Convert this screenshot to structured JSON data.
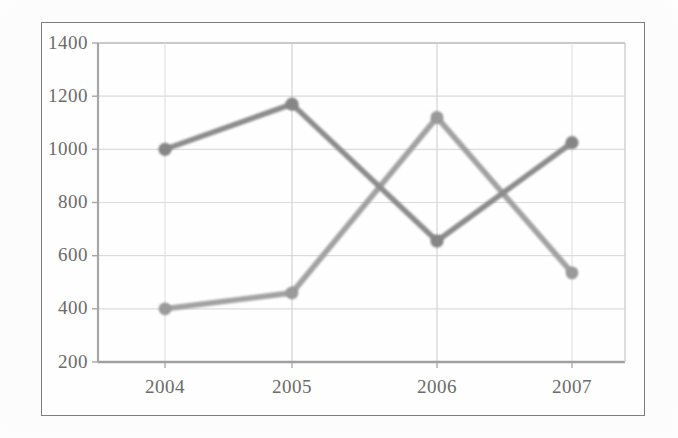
{
  "chart_data": {
    "type": "line",
    "title": "",
    "subtitle": "",
    "xlabel": "",
    "ylabel": "",
    "categories": [
      "2004",
      "2005",
      "2006",
      "2007"
    ],
    "ylim": [
      200,
      1400
    ],
    "yticks": [
      200,
      400,
      600,
      800,
      1000,
      1200,
      1400
    ],
    "ytick_labels": [
      "200",
      "400",
      "600",
      "800",
      "1000",
      "1200",
      "1400"
    ],
    "grid": true,
    "grid_axis": "both",
    "legend": "none",
    "series": [
      {
        "name": "series-1",
        "color": "#8c8c8c",
        "marker": "circle",
        "values": [
          1000,
          1170,
          655,
          1025
        ]
      },
      {
        "name": "series-2",
        "color": "#9a9a9a",
        "marker": "circle",
        "values": [
          400,
          460,
          1120,
          535
        ]
      }
    ],
    "annotations": []
  },
  "axes": {
    "y_tick_labels": [
      "1400",
      "1200",
      "1000",
      "800",
      "600",
      "400",
      "200"
    ],
    "x_tick_labels": [
      "2004",
      "2005",
      "2006",
      "2007"
    ]
  },
  "colors": {
    "frame_border": "#7c7c7c",
    "plot_background": "#ffffff",
    "gridline": "#d9d9d9",
    "axis_line": "#9e9e9e",
    "tick_text": "#6b6b6b",
    "series_1": "#8c8c8c",
    "series_2": "#9a9a9a",
    "page_background": "#fdfdfd"
  }
}
